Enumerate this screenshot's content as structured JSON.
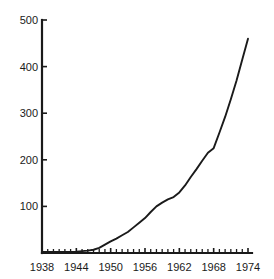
{
  "chart_data": {
    "type": "line",
    "title": "",
    "xlabel": "",
    "ylabel": "",
    "xlim": [
      1938,
      1974
    ],
    "ylim": [
      0,
      500
    ],
    "grid": false,
    "legend": null,
    "x_tick_labels": [
      "1938",
      "1944",
      "1950",
      "1956",
      "1962",
      "1968",
      "1974"
    ],
    "x_tick_values": [
      1938,
      1944,
      1950,
      1956,
      1962,
      1968,
      1974
    ],
    "x_minor_tick_values": [
      1939,
      1940,
      1941,
      1942,
      1943,
      1945,
      1946,
      1947,
      1948,
      1949,
      1951,
      1952,
      1953,
      1954,
      1955,
      1957,
      1958,
      1959,
      1960,
      1961,
      1963,
      1964,
      1965,
      1966,
      1967,
      1969,
      1970,
      1971,
      1972,
      1973
    ],
    "y_tick_labels": [
      "100",
      "200",
      "300",
      "400",
      "500"
    ],
    "y_tick_values": [
      100,
      200,
      300,
      400,
      500
    ],
    "series": [
      {
        "name": "series-1",
        "color": "#1a1a1a",
        "x": [
          1938,
          1940,
          1942,
          1944,
          1945,
          1946,
          1947,
          1948,
          1949,
          1950,
          1951,
          1952,
          1953,
          1954,
          1955,
          1956,
          1957,
          1958,
          1959,
          1960,
          1961,
          1962,
          1963,
          1964,
          1965,
          1966,
          1967,
          1968,
          1969,
          1970,
          1971,
          1972,
          1973,
          1974
        ],
        "values": [
          2,
          2,
          2,
          3,
          4,
          5,
          7,
          11,
          18,
          25,
          31,
          38,
          45,
          55,
          65,
          75,
          88,
          100,
          108,
          115,
          120,
          130,
          145,
          163,
          180,
          198,
          215,
          225,
          258,
          292,
          330,
          370,
          415,
          460
        ]
      }
    ]
  },
  "axis": {
    "line_color": "#1a1a1a",
    "tick_color": "#1a1a1a"
  }
}
